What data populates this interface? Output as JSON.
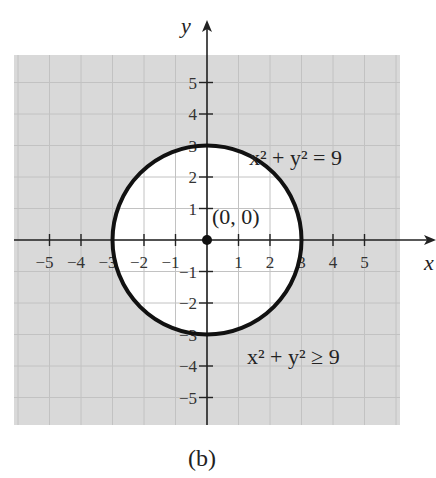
{
  "caption": "(b)",
  "chart_data": {
    "type": "region",
    "title": "",
    "xlabel": "x",
    "ylabel": "y",
    "xlim": [
      -6,
      6
    ],
    "ylim": [
      -6,
      6
    ],
    "grid": true,
    "x_ticks": [
      -5,
      -4,
      -3,
      -2,
      -1,
      1,
      2,
      3,
      4,
      5
    ],
    "y_ticks": [
      -5,
      -4,
      -3,
      -2,
      -1,
      1,
      2,
      3,
      4,
      5
    ],
    "x_tick_labels": [
      "−5",
      "−4",
      "−3",
      "−2",
      "−1",
      "1",
      "2",
      "3",
      "4",
      "5"
    ],
    "y_tick_labels": [
      "−5",
      "−4",
      "−3",
      "−2",
      "−1",
      "1",
      "2",
      "3",
      "4",
      "5"
    ],
    "circle": {
      "center": [
        0,
        0
      ],
      "radius": 3,
      "equation": "x² + y² = 9",
      "style": "solid"
    },
    "shaded_region": {
      "inequality": "x² + y² ≥ 9",
      "description": "outside of and on the circle"
    },
    "points": [
      {
        "x": 0,
        "y": 0,
        "label": "(0, 0)"
      }
    ],
    "annotations": [
      {
        "text": "x² + y² = 9",
        "position": "upper right"
      },
      {
        "text": "x² + y² ≥ 9",
        "position": "lower right"
      },
      {
        "text": "(0, 0)",
        "position": "near origin"
      }
    ],
    "colors": {
      "shade": "#d9d9d9",
      "gridline": "#bdbdbd",
      "inner_gridline": "#d4d4d4",
      "curve": "#111111",
      "axis": "#222222"
    }
  }
}
